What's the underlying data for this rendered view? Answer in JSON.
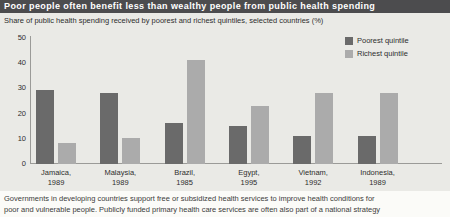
{
  "chart_data": {
    "type": "bar",
    "title": "Poor people often benefit less than wealthy people from public health spending",
    "subtitle": "Share of public health spending received by poorest and richest quintiles, selected countries (%)",
    "categories": [
      {
        "country": "Jamaica,",
        "year": "1989"
      },
      {
        "country": "Malaysia,",
        "year": "1989"
      },
      {
        "country": "Brazil,",
        "year": "1985"
      },
      {
        "country": "Egypt,",
        "year": "1995"
      },
      {
        "country": "Vietnam,",
        "year": "1992"
      },
      {
        "country": "Indonesia,",
        "year": "1989"
      }
    ],
    "series": [
      {
        "name": "Poorest quintile",
        "color": "#6a6a6a",
        "values": [
          29,
          28,
          16,
          15,
          11,
          11
        ]
      },
      {
        "name": "Richest quintile",
        "color": "#ababab",
        "values": [
          8,
          10,
          41,
          23,
          28,
          28
        ]
      }
    ],
    "xlabel": "",
    "ylabel": "",
    "ylim": [
      0,
      50
    ],
    "yticks": [
      0,
      10,
      20,
      30,
      40,
      50
    ],
    "grid": false,
    "legend_position": "top-right"
  },
  "caption": {
    "lines": [
      "Governments in developing countries support free or subsidized health services to improve health conditions for",
      "poor and vulnerable people. Publicly funded primary health care services are often also part of a national strategy"
    ]
  },
  "colors": {
    "title_bar": "#4c4c4e",
    "title_text": "#ffffff",
    "chart_background": "#eaeae6",
    "page_background": "#fbfbf8",
    "axis": "#9b9b98",
    "poorest_bar": "#6a6a6a",
    "richest_bar": "#ababab"
  }
}
